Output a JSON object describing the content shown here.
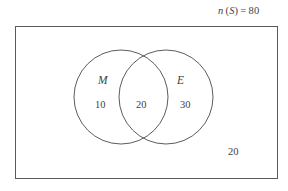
{
  "diagram": {
    "type": "venn-two-set",
    "title_caption": {
      "variable": "n",
      "set_symbol": "S",
      "equals": "=",
      "value": "80",
      "full_text": "n (S) = 80"
    },
    "universal_set": {
      "name": "S",
      "total": "80",
      "outside_count": "20"
    },
    "sets": [
      {
        "id": "M",
        "label": "M",
        "only_count": "10"
      },
      {
        "id": "E",
        "label": "E",
        "only_count": "30"
      }
    ],
    "intersection": {
      "label": "M and E",
      "count": "20"
    },
    "geometry": {
      "rect": {
        "x": 15,
        "y": 26,
        "w": 262,
        "h": 152
      },
      "circle_left": {
        "cx": 121,
        "cy": 97,
        "r": 47
      },
      "circle_right": {
        "cx": 166,
        "cy": 97,
        "r": 47
      }
    },
    "colors": {
      "stroke": "#4a4a4a",
      "rect_stroke": "#5a5a5a",
      "text": "#3f3f3f",
      "background": "#ffffff"
    }
  }
}
